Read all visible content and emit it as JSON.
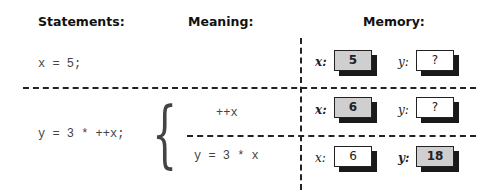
{
  "headers": {
    "statements": "Statements:",
    "meaning": "Meaning:",
    "memory": "Memory:"
  },
  "rows": [
    {
      "statement": "x = 5;",
      "memory": {
        "x": {
          "label": "x:",
          "value": "5",
          "highlighted": true
        },
        "y": {
          "label": "y:",
          "value": "?",
          "highlighted": false
        }
      }
    },
    {
      "statement": "y = 3 * ++x;",
      "meanings": [
        {
          "text": "++x",
          "memory": {
            "x": {
              "label": "x:",
              "value": "6",
              "highlighted": true
            },
            "y": {
              "label": "y:",
              "value": "?",
              "highlighted": false
            }
          }
        },
        {
          "text": "y = 3 * x",
          "memory": {
            "x": {
              "label": "x:",
              "value": "6",
              "highlighted": false
            },
            "y": {
              "label": "y:",
              "value": "18",
              "highlighted": true
            }
          }
        }
      ]
    }
  ],
  "brace_glyph": "{"
}
